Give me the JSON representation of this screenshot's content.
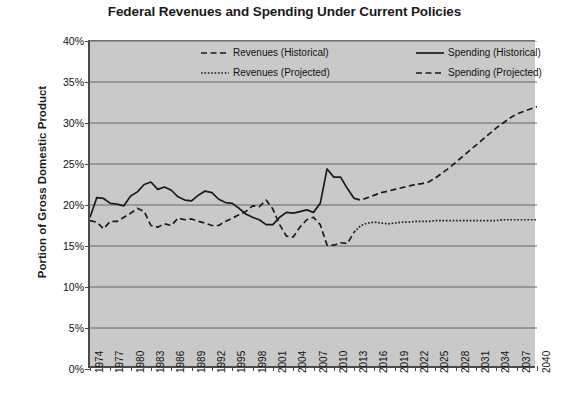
{
  "chart_data": {
    "type": "line",
    "title": "Federal Revenues and Spending Under Current Policies",
    "xlabel": "",
    "ylabel": "Portion of Gross Domestic Product",
    "ylim": [
      0,
      40
    ],
    "xlim": [
      1974,
      2040
    ],
    "ytick_labels": [
      "0%",
      "5%",
      "10%",
      "15%",
      "20%",
      "25%",
      "30%",
      "35%",
      "40%"
    ],
    "ytick_values": [
      0,
      5,
      10,
      15,
      20,
      25,
      30,
      35,
      40
    ],
    "xtick_labels": [
      "1974",
      "1977",
      "1980",
      "1983",
      "1986",
      "1989",
      "1992",
      "1995",
      "1998",
      "2001",
      "2004",
      "2007",
      "2010",
      "2013",
      "2016",
      "2019",
      "2022",
      "2025",
      "2028",
      "2031",
      "2034",
      "2037",
      "2040"
    ],
    "xtick_values": [
      1974,
      1977,
      1980,
      1983,
      1986,
      1989,
      1992,
      1995,
      1998,
      2001,
      2004,
      2007,
      2010,
      2013,
      2016,
      2019,
      2022,
      2025,
      2028,
      2031,
      2034,
      2037,
      2040
    ],
    "grid": "horizontal",
    "legend_position": "top-inside",
    "plot_background": "#c9c9c9",
    "line_color": "#1a1a1a",
    "series": [
      {
        "name": "Revenues (Historical)",
        "style": "dashed",
        "x": [
          1974,
          1975,
          1976,
          1977,
          1978,
          1979,
          1980,
          1981,
          1982,
          1983,
          1984,
          1985,
          1986,
          1987,
          1988,
          1989,
          1990,
          1991,
          1992,
          1993,
          1994,
          1995,
          1996,
          1997,
          1998,
          1999,
          2000,
          2001,
          2002,
          2003,
          2004,
          2005,
          2006,
          2007,
          2008,
          2009,
          2010,
          2011,
          2012,
          2013
        ],
        "values": [
          18.1,
          17.9,
          17.1,
          18.0,
          18.0,
          18.5,
          19.0,
          19.6,
          19.2,
          17.5,
          17.3,
          17.7,
          17.5,
          18.4,
          18.2,
          18.3,
          18.0,
          17.8,
          17.5,
          17.5,
          18.0,
          18.4,
          18.8,
          19.2,
          19.9,
          19.8,
          20.6,
          19.5,
          17.6,
          16.2,
          16.1,
          17.3,
          18.2,
          18.5,
          17.6,
          15.1,
          15.1,
          15.4,
          15.3,
          16.7
        ]
      },
      {
        "name": "Spending (Historical)",
        "style": "solid",
        "x": [
          1974,
          1975,
          1976,
          1977,
          1978,
          1979,
          1980,
          1981,
          1982,
          1983,
          1984,
          1985,
          1986,
          1987,
          1988,
          1989,
          1990,
          1991,
          1992,
          1993,
          1994,
          1995,
          1996,
          1997,
          1998,
          1999,
          2000,
          2001,
          2002,
          2003,
          2004,
          2005,
          2006,
          2007,
          2008,
          2009,
          2010,
          2011,
          2012,
          2013
        ],
        "values": [
          18.5,
          20.9,
          20.8,
          20.2,
          20.1,
          19.9,
          21.1,
          21.6,
          22.5,
          22.8,
          21.9,
          22.2,
          21.8,
          21.0,
          20.6,
          20.5,
          21.2,
          21.7,
          21.5,
          20.7,
          20.3,
          20.2,
          19.6,
          18.9,
          18.5,
          18.2,
          17.6,
          17.6,
          18.5,
          19.1,
          19.0,
          19.2,
          19.4,
          19.1,
          20.2,
          24.4,
          23.4,
          23.4,
          22.0,
          20.8
        ]
      },
      {
        "name": "Revenues (Projected)",
        "style": "dotted",
        "x": [
          2013,
          2014,
          2015,
          2016,
          2017,
          2018,
          2019,
          2020,
          2021,
          2022,
          2023,
          2024,
          2025,
          2026,
          2027,
          2028,
          2029,
          2030,
          2031,
          2032,
          2033,
          2034,
          2035,
          2036,
          2037,
          2038,
          2039,
          2040
        ],
        "values": [
          16.7,
          17.5,
          17.8,
          17.9,
          17.8,
          17.7,
          17.8,
          17.9,
          17.9,
          18.0,
          18.0,
          18.0,
          18.1,
          18.1,
          18.1,
          18.1,
          18.1,
          18.1,
          18.1,
          18.1,
          18.1,
          18.1,
          18.2,
          18.2,
          18.2,
          18.2,
          18.2,
          18.2
        ]
      },
      {
        "name": "Spending (Projected)",
        "style": "dashed",
        "x": [
          2013,
          2014,
          2015,
          2016,
          2017,
          2018,
          2019,
          2020,
          2021,
          2022,
          2023,
          2024,
          2025,
          2026,
          2027,
          2028,
          2029,
          2030,
          2031,
          2032,
          2033,
          2034,
          2035,
          2036,
          2037,
          2038,
          2039,
          2040
        ],
        "values": [
          20.8,
          20.6,
          20.9,
          21.2,
          21.5,
          21.7,
          21.9,
          22.1,
          22.3,
          22.5,
          22.6,
          22.8,
          23.3,
          23.9,
          24.5,
          25.2,
          25.9,
          26.6,
          27.3,
          28.0,
          28.7,
          29.4,
          30.0,
          30.6,
          31.1,
          31.4,
          31.7,
          32.0
        ]
      }
    ],
    "legend": [
      {
        "label": "Revenues (Historical)",
        "style": "dashed"
      },
      {
        "label": "Spending (Historical)",
        "style": "solid"
      },
      {
        "label": "Revenues (Projected)",
        "style": "dotted"
      },
      {
        "label": "Spending (Projected)",
        "style": "dashed"
      }
    ]
  }
}
